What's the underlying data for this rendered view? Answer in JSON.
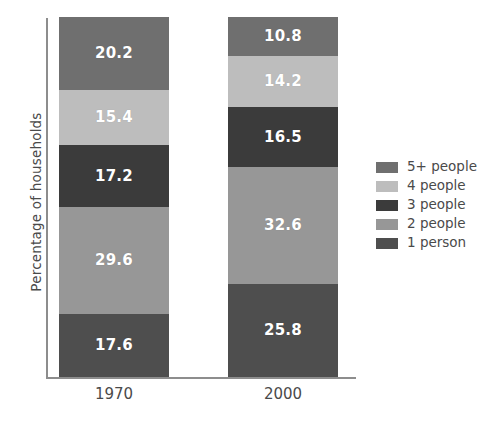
{
  "chart_data": {
    "type": "bar",
    "stacked": true,
    "orientation": "vertical",
    "title": "",
    "xlabel": "",
    "ylabel": "Percentage of households",
    "categories": [
      "1970",
      "2000"
    ],
    "ylim": [
      0,
      100
    ],
    "grid": false,
    "legend_position": "right",
    "stack_order_bottom_to_top": [
      "1 person",
      "2 people",
      "3 people",
      "4 people",
      "5+ people"
    ],
    "series": [
      {
        "name": "5+ people",
        "color": "#6f6f6f",
        "values": [
          20.2,
          10.8
        ]
      },
      {
        "name": "4 people",
        "color": "#bdbdbd",
        "values": [
          15.4,
          14.2
        ]
      },
      {
        "name": "3 people",
        "color": "#3b3b3b",
        "values": [
          17.2,
          16.5
        ]
      },
      {
        "name": "2 people",
        "color": "#979797",
        "values": [
          29.6,
          32.6
        ]
      },
      {
        "name": "1 person",
        "color": "#4e4e4e",
        "values": [
          17.6,
          25.8
        ]
      }
    ],
    "data_labels": {
      "1970": [
        "20.2",
        "15.4",
        "17.2",
        "29.6",
        "17.6"
      ],
      "2000": [
        "10.8",
        "14.2",
        "16.5",
        "32.6",
        "25.8"
      ]
    }
  },
  "legend": {
    "items": [
      {
        "label": "5+ people",
        "color": "#6f6f6f"
      },
      {
        "label": "4 people",
        "color": "#bdbdbd"
      },
      {
        "label": "3 people",
        "color": "#3b3b3b"
      },
      {
        "label": "2 people",
        "color": "#979797"
      },
      {
        "label": "1 person",
        "color": "#4e4e4e"
      }
    ]
  },
  "axes": {
    "y_title": "Percentage of households",
    "x_tick_labels": [
      "1970",
      "2000"
    ],
    "axis_color": "#8d8d8d"
  }
}
